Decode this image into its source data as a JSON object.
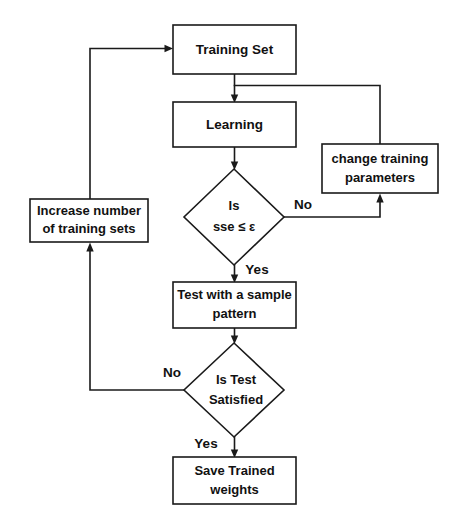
{
  "diagram": {
    "type": "flowchart",
    "background_color": "#ffffff",
    "line_color": "#1a1a1a",
    "text_color": "#111111",
    "nodes": [
      {
        "id": "training-set",
        "shape": "rectangle",
        "label": "Training Set",
        "lines": [
          "Training Set"
        ],
        "x": 173,
        "y": 25,
        "width": 123,
        "height": 49
      },
      {
        "id": "learning",
        "shape": "rectangle",
        "label": "Learning",
        "lines": [
          "Learning"
        ],
        "x": 173,
        "y": 102,
        "width": 123,
        "height": 45
      },
      {
        "id": "change-training-parameters",
        "shape": "rectangle",
        "label": "change training parameters",
        "lines": [
          "change training",
          "parameters"
        ],
        "x": 322,
        "y": 144,
        "width": 116,
        "height": 49
      },
      {
        "id": "sse-decision",
        "shape": "diamond",
        "label": "Is sse ≤ ε",
        "lines": [
          "Is",
          "sse ≤ ε"
        ],
        "cx": 234,
        "cy": 217,
        "rx": 50,
        "ry": 48
      },
      {
        "id": "increase-training-sets",
        "shape": "rectangle",
        "label": "Increase number of training sets",
        "lines": [
          "Increase number",
          "of training sets"
        ],
        "x": 30,
        "y": 199,
        "width": 118,
        "height": 43
      },
      {
        "id": "test-sample-pattern",
        "shape": "rectangle",
        "label": "Test with a sample pattern",
        "lines": [
          "Test with a sample",
          "pattern"
        ],
        "x": 173,
        "y": 282,
        "width": 123,
        "height": 46
      },
      {
        "id": "test-satisfied-decision",
        "shape": "diamond",
        "label": "Is Test Satisfied",
        "lines": [
          "Is Test",
          "Satisfied"
        ],
        "cx": 234,
        "cy": 390,
        "rx": 50,
        "ry": 47
      },
      {
        "id": "save-trained-weights",
        "shape": "rectangle",
        "label": "Save Trained weights",
        "lines": [
          "Save Trained",
          "weights"
        ],
        "x": 173,
        "y": 457,
        "width": 123,
        "height": 47
      }
    ],
    "edges": [
      {
        "id": "edge-training-to-learning",
        "from": "training-set",
        "to": "learning",
        "label": ""
      },
      {
        "id": "edge-learning-to-sse",
        "from": "learning",
        "to": "sse-decision",
        "label": ""
      },
      {
        "id": "edge-sse-no",
        "from": "sse-decision",
        "to": "change-training-parameters",
        "label": "No"
      },
      {
        "id": "edge-change-params-to-learning",
        "from": "change-training-parameters",
        "to": "learning",
        "label": ""
      },
      {
        "id": "edge-sse-yes",
        "from": "sse-decision",
        "to": "test-sample-pattern",
        "label": "Yes"
      },
      {
        "id": "edge-test-to-satisfied",
        "from": "test-sample-pattern",
        "to": "test-satisfied-decision",
        "label": ""
      },
      {
        "id": "edge-satisfied-no",
        "from": "test-satisfied-decision",
        "to": "increase-training-sets",
        "label": "No"
      },
      {
        "id": "edge-increase-to-training",
        "from": "increase-training-sets",
        "to": "training-set",
        "label": ""
      },
      {
        "id": "edge-satisfied-yes",
        "from": "test-satisfied-decision",
        "to": "save-trained-weights",
        "label": "Yes"
      }
    ],
    "edge_labels": {
      "sse_no": "No",
      "sse_yes": "Yes",
      "test_no": "No",
      "test_yes": "Yes"
    }
  }
}
